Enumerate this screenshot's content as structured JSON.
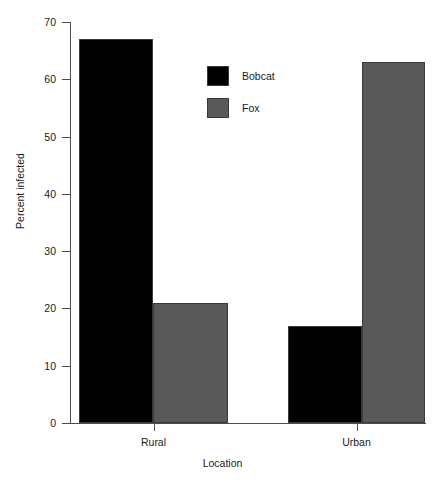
{
  "chart_data": {
    "type": "bar",
    "title": "",
    "xlabel": "Location",
    "ylabel": "Percent infected",
    "categories": [
      "Rural",
      "Urban"
    ],
    "series": [
      {
        "name": "Bobcat",
        "color": "#000000",
        "values": [
          67,
          17
        ]
      },
      {
        "name": "Fox",
        "color": "#595959",
        "values": [
          21,
          63
        ]
      }
    ],
    "ylim": [
      0,
      70
    ],
    "yticks": [
      0,
      10,
      20,
      30,
      40,
      50,
      60,
      70
    ],
    "ytick_labels": [
      "0",
      "10",
      "20",
      "30",
      "40",
      "50",
      "60",
      "70"
    ],
    "grid": false,
    "legend_position": "upper-center",
    "bar_grouping": "grouped"
  },
  "axes": {
    "y_title": "Percent infected",
    "x_title": "Location",
    "y_labels": [
      "70",
      "60",
      "50",
      "40",
      "30",
      "20",
      "10",
      "0"
    ],
    "x_labels": [
      "Rural",
      "Urban"
    ]
  },
  "legend": {
    "entries": [
      {
        "label": "Bobcat",
        "swatch": "#000000"
      },
      {
        "label": "Fox",
        "swatch": "#595959"
      }
    ]
  },
  "bars": [
    {
      "name": "rural-bobcat",
      "group": "Rural",
      "series": "Bobcat",
      "value": 67,
      "color": "#000000",
      "left": 79,
      "width": 74
    },
    {
      "name": "rural-fox",
      "group": "Rural",
      "series": "Fox",
      "value": 21,
      "color": "#595959",
      "left": 153,
      "width": 75
    },
    {
      "name": "urban-bobcat",
      "group": "Urban",
      "series": "Bobcat",
      "value": 17,
      "color": "#000000",
      "left": 288,
      "width": 74
    },
    {
      "name": "urban-fox",
      "group": "Urban",
      "series": "Fox",
      "value": 63,
      "color": "#595959",
      "left": 362,
      "width": 63
    }
  ]
}
